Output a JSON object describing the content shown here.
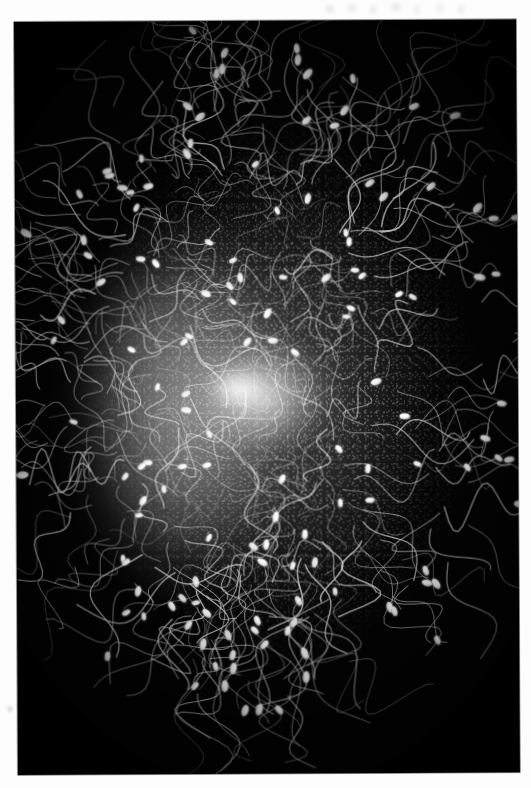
{
  "page": {
    "background_color": "#fdfdfd",
    "width": 531,
    "height": 788,
    "caption": ""
  },
  "photo": {
    "name": "darkfield-micrograph",
    "background_color": "#030303",
    "frame": {
      "left": 14,
      "top": 22,
      "width": 502,
      "height": 753,
      "rotation_deg": -0.3
    },
    "subject": "sperm cells surrounding an ovum",
    "technique": "dark-field light micrograph",
    "palette": {
      "field": "#030303",
      "cell_bright": "#ffffff",
      "cell_mid": "#d8d8d8",
      "cell_dim": "#8a8a8a",
      "halo": "#b4b4b4"
    },
    "mass": {
      "center_x": 245,
      "center_y": 345,
      "radius_x": 215,
      "radius_y": 300,
      "core_center_x": 222,
      "core_center_y": 372,
      "core_radius": 40
    }
  },
  "artifacts": [
    {
      "name": "top-edge-smudge",
      "left": 318,
      "top": 0,
      "width": 155,
      "height": 19,
      "opacity": 0.3
    },
    {
      "name": "left-margin-mark",
      "left": 2,
      "top": 700,
      "width": 16,
      "height": 18,
      "opacity": 0.42
    },
    {
      "name": "bottom-edge-smudge",
      "left": 30,
      "top": 766,
      "width": 26,
      "height": 9,
      "opacity": 0.22
    }
  ],
  "cells": {
    "count_drawn": 96,
    "head_length_px": 9,
    "head_width_px": 5,
    "tail_length_px_range": [
      40,
      130
    ],
    "description": "elongated bright oval heads with long sinuous flagella radiating outward from a dense central cluster"
  },
  "chart_data": {
    "type": "scatter",
    "title": "",
    "xlabel": "",
    "ylabel": "",
    "note": "not a chart - photographic micrograph"
  }
}
